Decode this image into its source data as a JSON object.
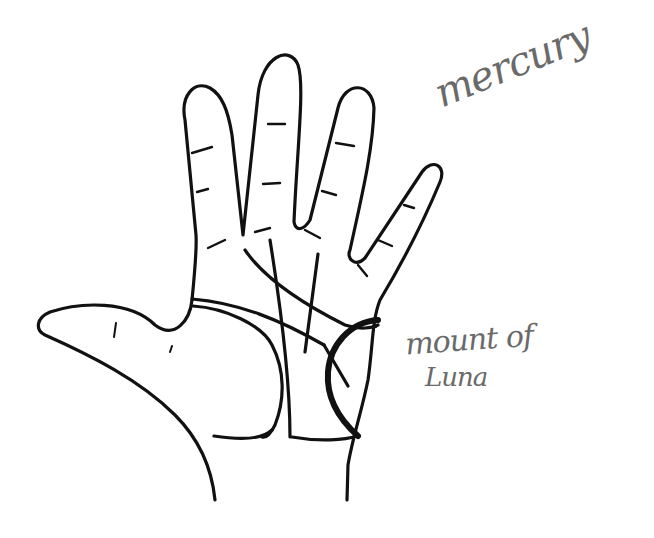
{
  "diagram": {
    "stroke_color": "#111111",
    "label_color": "#6a6a6a",
    "labels": {
      "mercury": "mercury",
      "mount_of": "mount of",
      "luna": "Luna"
    },
    "features": {
      "hand_outline": "open left-facing palm with thumb extended",
      "lines": [
        "heart line",
        "head line",
        "life line",
        "fate line",
        "sun line"
      ],
      "highlighted_region": "mount of Luna (bold arc)"
    }
  }
}
